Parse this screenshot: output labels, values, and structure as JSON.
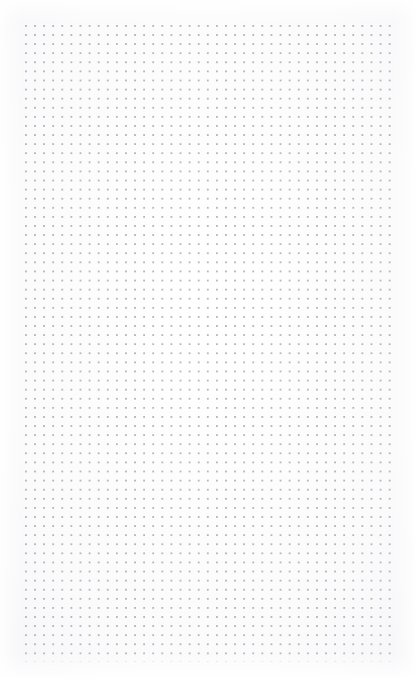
{
  "page": {
    "kind": "dot-grid-sheet",
    "width": 415,
    "height": 678,
    "background_color": "#ffffff",
    "paper_tint_color": "#f7f7f9",
    "title": ""
  },
  "grid": {
    "dot_color": "#a9a9b0",
    "dot_radius_px": 0.9,
    "spacing_px": 9.1,
    "left_px": 25,
    "top_px": 25,
    "right_px": 392,
    "bottom_px": 662,
    "width_px": 367,
    "height_px": 637,
    "columns": 41,
    "rows": 71,
    "opacity": 0.85
  },
  "margins": {
    "left_px": 25,
    "top_px": 25,
    "right_px": 23,
    "bottom_px": 16,
    "color": "#ffffff"
  },
  "content": {
    "text": "",
    "annotations": [],
    "note": ""
  }
}
